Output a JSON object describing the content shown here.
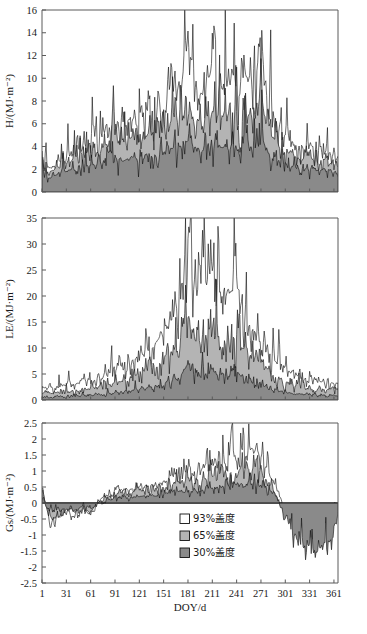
{
  "figure": {
    "panels": [
      {
        "id": "panel-H",
        "ylabel": "H/(MJ·m⁻²)",
        "yticks": [
          "0",
          "2",
          "4",
          "6",
          "8",
          "10",
          "12",
          "14",
          "16"
        ]
      },
      {
        "id": "panel-LE",
        "ylabel": "LE/(MJ·m⁻²)",
        "yticks": [
          "0",
          "5",
          "10",
          "15",
          "20",
          "25",
          "30",
          "35"
        ]
      },
      {
        "id": "panel-Gs",
        "ylabel": "Gs/(MJ·m⁻²)",
        "yticks": [
          "-2.5",
          "-2",
          "-1.5",
          "-1",
          "-0.5",
          "0",
          "0.5",
          "1",
          "1.5",
          "2",
          "2.5"
        ]
      }
    ],
    "xlabel": "DOY/d",
    "xticks": [
      "1",
      "31",
      "61",
      "91",
      "121",
      "151",
      "181",
      "211",
      "241",
      "271",
      "301",
      "331",
      "361"
    ],
    "legend": [
      {
        "label": "93%盖度",
        "color": "#ffffff"
      },
      {
        "label": "65%盖度",
        "color": "#b4b4b4"
      },
      {
        "label": "30%盖度",
        "color": "#8a8a8a"
      }
    ]
  },
  "chart_data": [
    {
      "type": "area",
      "title": "",
      "xlabel": "DOY/d",
      "ylabel": "H/(MJ·m⁻²)",
      "xlim": [
        1,
        366
      ],
      "ylim": [
        0,
        16
      ],
      "ytick_values": [
        0,
        2,
        4,
        6,
        8,
        10,
        12,
        14,
        16
      ],
      "xtick_values": [
        1,
        31,
        61,
        91,
        121,
        151,
        181,
        211,
        241,
        271,
        301,
        331,
        361
      ],
      "grid": false,
      "legend_position": "panel-3-inside-right",
      "note": "Three stacked/overlaid daily sensible heat flux series for grass cover 93%, 65% and 30%; daily noisy values, seasonal rise from DOY 1 to peak around DOY 180-260, maximum single-day spike about 13.5 near DOY 181; filled envelopes white over light gray over dark gray.",
      "series": [
        {
          "name": "93%盖度",
          "fill": "#ffffff",
          "x": [
            1,
            11,
            21,
            31,
            41,
            51,
            61,
            71,
            81,
            91,
            101,
            111,
            121,
            131,
            141,
            151,
            161,
            171,
            181,
            191,
            201,
            211,
            221,
            231,
            241,
            251,
            261,
            271,
            281,
            291,
            301,
            311,
            321,
            331,
            341,
            351,
            361,
            366
          ],
          "values": [
            2.4,
            2.0,
            2.6,
            3.0,
            3.4,
            3.8,
            4.6,
            4.3,
            5.6,
            6.2,
            5.4,
            6.5,
            5.8,
            7.2,
            6.6,
            7.8,
            8.6,
            9.4,
            13.5,
            9.2,
            8.4,
            11.2,
            9.0,
            9.6,
            8.8,
            10.2,
            9.4,
            11.8,
            7.6,
            6.2,
            5.0,
            4.4,
            3.8,
            4.2,
            3.4,
            3.6,
            3.2,
            3.0
          ]
        },
        {
          "name": "65%盖度",
          "fill": "#b4b4b4",
          "x": [
            1,
            11,
            21,
            31,
            41,
            51,
            61,
            71,
            81,
            91,
            101,
            111,
            121,
            131,
            141,
            151,
            161,
            171,
            181,
            191,
            201,
            211,
            221,
            231,
            241,
            251,
            261,
            271,
            281,
            291,
            301,
            311,
            321,
            331,
            341,
            351,
            361,
            366
          ],
          "values": [
            2.2,
            1.8,
            2.2,
            2.6,
            2.8,
            3.0,
            3.6,
            3.4,
            4.2,
            4.6,
            4.0,
            4.8,
            4.2,
            5.2,
            4.8,
            5.6,
            6.2,
            6.6,
            7.4,
            6.4,
            6.0,
            7.2,
            6.4,
            6.8,
            6.2,
            7.0,
            6.6,
            8.2,
            5.4,
            4.4,
            3.6,
            3.2,
            2.8,
            3.0,
            2.6,
            2.8,
            2.4,
            2.3
          ]
        },
        {
          "name": "30%盖度",
          "fill": "#8a8a8a",
          "x": [
            1,
            11,
            21,
            31,
            41,
            51,
            61,
            71,
            81,
            91,
            101,
            111,
            121,
            131,
            141,
            151,
            161,
            171,
            181,
            191,
            201,
            211,
            221,
            231,
            241,
            251,
            261,
            271,
            281,
            291,
            301,
            311,
            321,
            331,
            341,
            351,
            361,
            366
          ],
          "values": [
            1.6,
            1.2,
            1.6,
            1.9,
            2.0,
            2.1,
            2.5,
            2.4,
            2.8,
            3.0,
            2.7,
            3.1,
            2.8,
            3.3,
            3.1,
            3.5,
            3.8,
            4.0,
            4.4,
            3.9,
            3.7,
            4.3,
            3.9,
            4.1,
            3.8,
            4.2,
            4.0,
            4.8,
            3.4,
            2.9,
            2.5,
            2.2,
            2.0,
            2.1,
            1.9,
            2.0,
            1.8,
            1.7
          ]
        }
      ]
    },
    {
      "type": "area",
      "title": "",
      "xlabel": "DOY/d",
      "ylabel": "LE/(MJ·m⁻²)",
      "xlim": [
        1,
        366
      ],
      "ylim": [
        0,
        35
      ],
      "ytick_values": [
        0,
        5,
        10,
        15,
        20,
        25,
        30,
        35
      ],
      "xtick_values": [
        1,
        31,
        61,
        91,
        121,
        151,
        181,
        211,
        241,
        271,
        301,
        331,
        361
      ],
      "grid": false,
      "legend_position": "panel-3-inside-right",
      "note": "Daily latent heat flux; strong summer peak near DOY 181 reaching about 32, broad elevated band DOY 150-270, low values in winter.",
      "series": [
        {
          "name": "93%盖度",
          "fill": "#ffffff",
          "x": [
            1,
            11,
            21,
            31,
            41,
            51,
            61,
            71,
            81,
            91,
            101,
            111,
            121,
            131,
            141,
            151,
            161,
            171,
            181,
            191,
            201,
            211,
            221,
            231,
            241,
            251,
            261,
            271,
            281,
            291,
            301,
            311,
            321,
            331,
            341,
            351,
            361,
            366
          ],
          "values": [
            2.6,
            2.2,
            2.8,
            3.2,
            3.0,
            3.6,
            4.0,
            4.4,
            5.0,
            5.6,
            6.4,
            7.2,
            8.0,
            9.6,
            11.0,
            13.0,
            16.0,
            20.0,
            32.0,
            19.0,
            21.0,
            25.0,
            17.0,
            20.0,
            22.0,
            16.0,
            14.0,
            12.0,
            9.0,
            7.0,
            6.0,
            5.0,
            4.4,
            4.0,
            3.6,
            3.4,
            3.2,
            3.0
          ]
        },
        {
          "name": "65%盖度",
          "fill": "#b4b4b4",
          "x": [
            1,
            11,
            21,
            31,
            41,
            51,
            61,
            71,
            81,
            91,
            101,
            111,
            121,
            131,
            141,
            151,
            161,
            171,
            181,
            191,
            201,
            211,
            221,
            231,
            241,
            251,
            261,
            271,
            281,
            291,
            301,
            311,
            321,
            331,
            341,
            351,
            361,
            366
          ],
          "values": [
            1.4,
            1.2,
            1.5,
            1.8,
            1.7,
            2.0,
            2.3,
            2.6,
            3.0,
            3.4,
            3.8,
            4.4,
            5.0,
            5.8,
            6.6,
            8.0,
            9.4,
            11.0,
            17.0,
            10.5,
            12.0,
            14.0,
            10.0,
            11.5,
            12.5,
            9.5,
            8.4,
            7.2,
            5.6,
            4.4,
            3.6,
            3.0,
            2.6,
            2.4,
            2.1,
            2.0,
            1.9,
            1.8
          ]
        },
        {
          "name": "30%盖度",
          "fill": "#8a8a8a",
          "x": [
            1,
            11,
            21,
            31,
            41,
            51,
            61,
            71,
            81,
            91,
            101,
            111,
            121,
            131,
            141,
            151,
            161,
            171,
            181,
            191,
            201,
            211,
            221,
            231,
            241,
            251,
            261,
            271,
            281,
            291,
            301,
            311,
            321,
            331,
            341,
            351,
            361,
            366
          ],
          "values": [
            0.6,
            0.5,
            0.6,
            0.7,
            0.7,
            0.8,
            0.9,
            1.0,
            1.2,
            1.4,
            1.6,
            1.8,
            2.1,
            2.4,
            2.8,
            3.3,
            3.9,
            4.6,
            6.6,
            4.4,
            5.0,
            5.8,
            4.2,
            4.8,
            5.2,
            4.0,
            3.5,
            3.0,
            2.3,
            1.8,
            1.5,
            1.2,
            1.1,
            1.0,
            0.9,
            0.8,
            0.8,
            0.7
          ]
        }
      ]
    },
    {
      "type": "area",
      "title": "",
      "xlabel": "DOY/d",
      "ylabel": "Gs/(MJ·m⁻²)",
      "xlim": [
        1,
        366
      ],
      "ylim": [
        -2.5,
        2.5
      ],
      "ytick_values": [
        -2.5,
        -2,
        -1.5,
        -1,
        -0.5,
        0,
        0.5,
        1,
        1.5,
        2,
        2.5
      ],
      "xtick_values": [
        1,
        31,
        61,
        91,
        121,
        151,
        181,
        211,
        241,
        271,
        301,
        331,
        361
      ],
      "grid": false,
      "legend_position": "inside-right",
      "note": "Daily soil heat flux oscillating about zero; large negative excursions to about -1.1 during DOY 10-80, positive envelope growing to about 1.8-2.2 between DOY 150-290, then shifting strongly negative (to about -1.8) after DOY 300.",
      "series": [
        {
          "name": "93%盖度",
          "fill": "#ffffff",
          "x": [
            1,
            11,
            21,
            31,
            41,
            51,
            61,
            71,
            81,
            91,
            101,
            111,
            121,
            131,
            141,
            151,
            161,
            171,
            181,
            191,
            201,
            211,
            221,
            231,
            241,
            251,
            261,
            271,
            281,
            291,
            301,
            311,
            321,
            331,
            341,
            351,
            361,
            366
          ],
          "values": [
            0.45,
            -0.6,
            -0.5,
            -0.3,
            -0.4,
            -0.2,
            -0.35,
            0.1,
            0.25,
            0.35,
            0.4,
            0.45,
            0.5,
            0.6,
            0.55,
            0.7,
            0.8,
            0.9,
            1.0,
            0.95,
            1.1,
            1.2,
            1.3,
            1.4,
            1.5,
            1.6,
            1.7,
            1.5,
            0.9,
            0.4,
            -0.15,
            -0.2,
            -0.25,
            -0.2,
            -0.3,
            -0.25,
            -0.2,
            0.0
          ]
        },
        {
          "name": "65%盖度",
          "fill": "#b4b4b4",
          "x": [
            1,
            11,
            21,
            31,
            41,
            51,
            61,
            71,
            81,
            91,
            101,
            111,
            121,
            131,
            141,
            151,
            161,
            171,
            181,
            191,
            201,
            211,
            221,
            231,
            241,
            251,
            261,
            271,
            281,
            291,
            301,
            311,
            321,
            331,
            341,
            351,
            361,
            366
          ],
          "values": [
            0.3,
            -0.5,
            -0.4,
            -0.25,
            -0.3,
            -0.15,
            -0.3,
            0.05,
            0.18,
            0.25,
            0.3,
            0.32,
            0.36,
            0.42,
            0.4,
            0.5,
            0.55,
            0.62,
            0.7,
            0.66,
            0.75,
            0.82,
            0.9,
            0.95,
            1.0,
            1.1,
            1.15,
            1.0,
            0.6,
            0.25,
            -0.3,
            -0.5,
            -0.7,
            -0.8,
            -0.9,
            -0.7,
            -0.5,
            -0.1
          ]
        },
        {
          "name": "30%盖度",
          "fill": "#8a8a8a",
          "x": [
            1,
            11,
            21,
            31,
            41,
            51,
            61,
            71,
            81,
            91,
            101,
            111,
            121,
            131,
            141,
            151,
            161,
            171,
            181,
            191,
            201,
            211,
            221,
            231,
            241,
            251,
            261,
            271,
            281,
            291,
            301,
            311,
            321,
            331,
            341,
            351,
            361,
            366
          ],
          "values": [
            0.2,
            -0.35,
            -0.3,
            -0.18,
            -0.22,
            -0.1,
            -0.2,
            0.03,
            0.1,
            0.14,
            0.17,
            0.18,
            0.2,
            0.24,
            0.22,
            0.28,
            0.32,
            0.36,
            0.4,
            0.38,
            0.43,
            0.47,
            0.52,
            0.55,
            0.58,
            0.63,
            0.66,
            0.58,
            0.35,
            0.14,
            -0.5,
            -0.9,
            -1.2,
            -1.4,
            -1.5,
            -1.2,
            -0.9,
            -0.3
          ]
        }
      ]
    }
  ]
}
